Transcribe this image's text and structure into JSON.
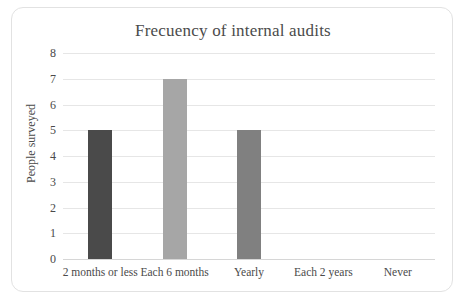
{
  "chart_data": {
    "type": "bar",
    "title": "Frecuency of internal audits",
    "xlabel": "",
    "ylabel": "People surveyed",
    "categories": [
      "2 months or less",
      "Each 6 months",
      "Yearly",
      "Each 2 years",
      "Never"
    ],
    "values": [
      5,
      7,
      5,
      0,
      0
    ],
    "ylim": [
      0,
      8
    ],
    "yticks": [
      0,
      1,
      2,
      3,
      4,
      5,
      6,
      7,
      8
    ],
    "ytick_labels": [
      "0",
      "1",
      "2",
      "3",
      "4",
      "5",
      "6",
      "7",
      "8"
    ],
    "grid": true,
    "legend": false,
    "bar_colors": [
      "#4a4a4a",
      "#a6a6a6",
      "#808080",
      "#808080",
      "#808080"
    ],
    "gridline_color": "#e6e6e6",
    "frame_color": "#e2e2e2",
    "text_color": "#4a4a4a"
  }
}
